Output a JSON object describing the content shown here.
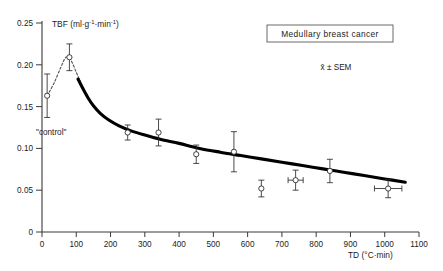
{
  "figure": {
    "legend_label": "Medullary breast cancer",
    "stats_note": "x̄ ± SEM",
    "control_label": "\"control\"",
    "y_axis_title_main": "TBF (ml",
    "y_axis_title_full": "TBF (ml·g⁻¹·min⁻¹)",
    "x_axis_title_full": "TD (°C·min)",
    "ink_color": "#1a1a1a",
    "curve_color": "#000000",
    "marker_fill": "#ffffff"
  },
  "y_axis_title_parts": {
    "p1": "TBF (ml",
    "dot1": "·",
    "g": "g",
    "exp1": "-1",
    "dot2": "·",
    "min": "min",
    "exp2": "-1",
    "close": ")"
  },
  "x_axis_title_parts": {
    "p1": "TD (",
    "deg": "°C",
    "dot": "·",
    "min": "min",
    "close": ")"
  },
  "chart_data": {
    "type": "scatter",
    "title": "Medullary breast cancer",
    "xlabel": "TD (°C·min)",
    "ylabel": "TBF (ml·g⁻¹·min⁻¹)",
    "xlim": [
      0,
      1100
    ],
    "ylim": [
      0,
      0.25
    ],
    "grid": false,
    "legend_position": "top-right-boxed",
    "xticks": [
      0,
      100,
      200,
      300,
      400,
      500,
      600,
      700,
      800,
      900,
      1000,
      1100
    ],
    "xticklabels": [
      "0",
      "100",
      "200",
      "300",
      "400",
      "500",
      "600",
      "700",
      "800",
      "900",
      "1000",
      "1100"
    ],
    "yticks": [
      0,
      0.05,
      0.1,
      0.15,
      0.2,
      0.25
    ],
    "yticklabels": [
      "0",
      "0.05",
      "0.10",
      "0.15",
      "0.20",
      "0.25"
    ],
    "annotations": [
      {
        "text": "Medullary breast cancer",
        "x": 680,
        "y": 0.238,
        "boxed": true
      },
      {
        "text": "x̄ ± SEM",
        "x": 800,
        "y": 0.207,
        "boxed": false
      },
      {
        "text": "\"control\"",
        "x": 40,
        "y": 0.122,
        "boxed": false
      }
    ],
    "series": [
      {
        "name": "TBF mean ± SEM",
        "marker": "open-circle",
        "points": [
          {
            "x": 15,
            "y": 0.163,
            "yerr": 0.026,
            "xerr": null,
            "label": "control"
          },
          {
            "x": 80,
            "y": 0.209,
            "yerr": 0.016,
            "xerr": null,
            "label": ""
          },
          {
            "x": 250,
            "y": 0.119,
            "yerr": 0.009,
            "xerr": null,
            "label": ""
          },
          {
            "x": 340,
            "y": 0.119,
            "yerr": 0.016,
            "xerr": null,
            "label": ""
          },
          {
            "x": 450,
            "y": 0.093,
            "yerr": 0.011,
            "xerr": null,
            "label": ""
          },
          {
            "x": 560,
            "y": 0.096,
            "yerr": 0.024,
            "xerr": null,
            "label": ""
          },
          {
            "x": 640,
            "y": 0.052,
            "yerr": 0.01,
            "xerr": null,
            "label": ""
          },
          {
            "x": 740,
            "y": 0.062,
            "yerr": 0.012,
            "xerr": 22,
            "label": ""
          },
          {
            "x": 840,
            "y": 0.073,
            "yerr": 0.014,
            "xerr": null,
            "label": ""
          },
          {
            "x": 1010,
            "y": 0.052,
            "yerr": 0.011,
            "xerr": 40,
            "label": ""
          }
        ]
      },
      {
        "name": "fitted decay curve",
        "style": "solid-thick",
        "x": [
          105,
          120,
          135,
          150,
          170,
          195,
          225,
          260,
          300,
          345,
          400,
          460,
          520,
          580,
          640,
          700,
          760,
          820,
          880,
          940,
          1000,
          1060
        ],
        "y": [
          0.183,
          0.171,
          0.16,
          0.151,
          0.142,
          0.134,
          0.127,
          0.121,
          0.116,
          0.111,
          0.106,
          0.1,
          0.0955,
          0.0915,
          0.0875,
          0.0835,
          0.0795,
          0.0755,
          0.0715,
          0.0675,
          0.0635,
          0.0595
        ]
      },
      {
        "name": "rise segment (dashed)",
        "style": "dashed-thin",
        "x": [
          15,
          35,
          55,
          70,
          85,
          100,
          112
        ],
        "y": [
          0.163,
          0.178,
          0.197,
          0.209,
          0.205,
          0.191,
          0.18
        ]
      }
    ]
  }
}
